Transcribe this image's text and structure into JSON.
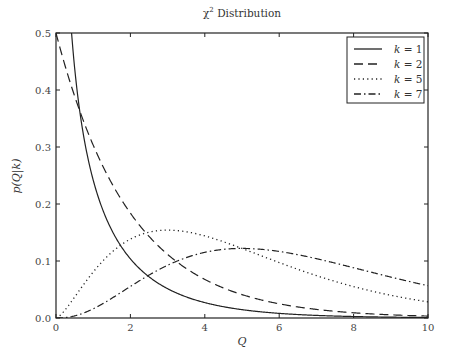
{
  "chart_data": {
    "type": "line",
    "title_main": "χ",
    "title_sup": "2",
    "title_rest": " Distribution",
    "xlabel": "Q",
    "ylabel": "p(Q|k)",
    "xlim": [
      0,
      10
    ],
    "ylim": [
      0,
      0.5
    ],
    "xticks": [
      0,
      2,
      4,
      6,
      8,
      10
    ],
    "xtick_labels": [
      "0",
      "2",
      "4",
      "6",
      "8",
      "10"
    ],
    "yticks": [
      0.0,
      0.1,
      0.2,
      0.3,
      0.4,
      0.5
    ],
    "ytick_labels": [
      "0.0",
      "0.1",
      "0.2",
      "0.3",
      "0.4",
      "0.5"
    ],
    "grid": false,
    "legend_position": "upper right",
    "series": [
      {
        "name": "k = 1",
        "k": 1,
        "style": "solid",
        "dash": "",
        "color": "#222222",
        "x": [
          0.25,
          0.5,
          1,
          1.5,
          2,
          3,
          4,
          5,
          6,
          8,
          10
        ],
        "values": [
          0.704,
          0.439,
          0.242,
          0.154,
          0.104,
          0.051,
          0.027,
          0.015,
          0.008,
          0.003,
          0.001
        ]
      },
      {
        "name": "k = 2",
        "k": 2,
        "style": "dashed",
        "dash": "9,5",
        "color": "#222222",
        "x": [
          0,
          1,
          2,
          3,
          4,
          5,
          6,
          8,
          10
        ],
        "values": [
          0.5,
          0.303,
          0.184,
          0.112,
          0.068,
          0.041,
          0.025,
          0.009,
          0.003
        ]
      },
      {
        "name": "k = 5",
        "k": 5,
        "style": "dotted",
        "dash": "1.2,3.2",
        "color": "#222222",
        "x": [
          0,
          1,
          2,
          3,
          4,
          5,
          6,
          8,
          10
        ],
        "values": [
          0,
          0.081,
          0.138,
          0.154,
          0.144,
          0.122,
          0.097,
          0.055,
          0.028
        ]
      },
      {
        "name": "k = 7",
        "k": 7,
        "style": "dashdot",
        "dash": "7,3,1.5,3",
        "color": "#222222",
        "x": [
          0,
          1,
          2,
          3,
          4,
          5,
          6,
          8,
          10
        ],
        "values": [
          0,
          0.016,
          0.058,
          0.096,
          0.116,
          0.12,
          0.111,
          0.078,
          0.045
        ]
      }
    ]
  },
  "legend": {
    "items": [
      {
        "label": "k = 1"
      },
      {
        "label": "k = 2"
      },
      {
        "label": "k = 5"
      },
      {
        "label": "k = 7"
      }
    ]
  }
}
